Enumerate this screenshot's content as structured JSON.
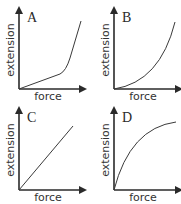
{
  "figure": {
    "panels": [
      {
        "letter": "A",
        "xlabel": "force",
        "ylabel": "extension",
        "shape": "linear-then-steep"
      },
      {
        "letter": "B",
        "xlabel": "force",
        "ylabel": "extension",
        "shape": "concave-up"
      },
      {
        "letter": "C",
        "xlabel": "force",
        "ylabel": "extension",
        "shape": "linear"
      },
      {
        "letter": "D",
        "xlabel": "force",
        "ylabel": "extension",
        "shape": "concave-down"
      }
    ]
  },
  "colors": {
    "axis": "#2a2a2a",
    "curve": "#3a3a3a",
    "background": "#ffffff"
  }
}
